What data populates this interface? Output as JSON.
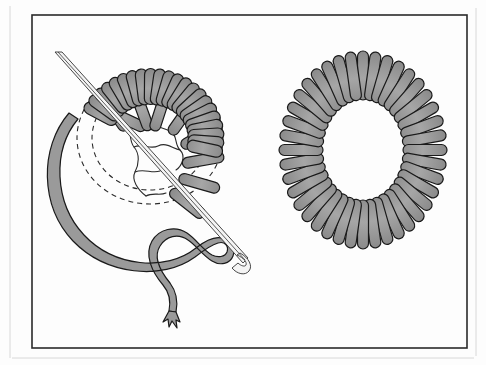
{
  "figure": {
    "kind": "line-art illustration",
    "background_color": "#ffffff",
    "outline_color": "#1a1a1a",
    "thread_fill_color": "#9a9a9a",
    "thread_fill_color_light": "#ababab",
    "guide_line_color": "#2b2b2b",
    "frame": {
      "name": "picture-frame",
      "x": 32,
      "y": 15,
      "width": 435,
      "height": 333,
      "stroke_color": "#2a2a2a"
    },
    "outer_edge": {
      "name": "page-edge",
      "stroke_color": "#d8d8d8"
    },
    "panels": [
      {
        "id": "left",
        "name": "eyelet-in-progress",
        "caption": "",
        "center_x": 143,
        "center_y": 160,
        "outer_radius": 72,
        "inner_radius": 52,
        "stitch_count": 30,
        "has_needle": true,
        "has_working_thread": true,
        "has_guide_circles": true,
        "guide_circles": 2
      },
      {
        "id": "right",
        "name": "completed-eyelet",
        "caption": "",
        "center_x": 363,
        "center_y": 150,
        "outer_radius_x": 80,
        "outer_radius_y": 95,
        "inner_radius_x": 44,
        "inner_radius_y": 54,
        "stitch_count": 40,
        "has_needle": false,
        "has_working_thread": false,
        "has_guide_circles": false
      }
    ],
    "needle": {
      "name": "sewing-needle",
      "tip_x": 55,
      "tip_y": 52,
      "eye_x": 243,
      "eye_y": 264,
      "color": "#f4f4f4",
      "stroke": "#333333"
    },
    "thread_tail": {
      "name": "frayed-thread-end",
      "x": 170,
      "y": 325
    }
  },
  "geometry": {
    "left_radial_stitches": [
      {
        "angle": -96,
        "r_in": 40,
        "r_out": 70,
        "w": 9,
        "style": "sparse"
      },
      {
        "angle": -78,
        "r_in": 40,
        "r_out": 70,
        "w": 9,
        "style": "sparse"
      },
      {
        "angle": -60,
        "r_in": 40,
        "r_out": 70,
        "w": 9,
        "style": "sparse"
      },
      {
        "angle": -42,
        "r_in": 40,
        "r_out": 70,
        "w": 9,
        "style": "sparse"
      },
      {
        "angle": -24,
        "r_in": 40,
        "r_out": 70,
        "w": 9,
        "style": "sparse"
      },
      {
        "angle": -6,
        "r_in": 40,
        "r_out": 70,
        "w": 9,
        "style": "sparse"
      },
      {
        "angle": 12,
        "r_in": 40,
        "r_out": 70,
        "w": 9,
        "style": "sparse"
      },
      {
        "angle": 30,
        "r_in": 40,
        "r_out": 70,
        "w": 9,
        "style": "sparse"
      }
    ],
    "left_coil_stitches_count": 22,
    "right_stitches_count": 40
  }
}
